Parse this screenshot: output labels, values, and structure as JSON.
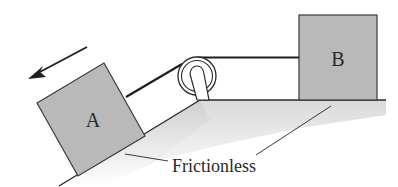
{
  "diagram": {
    "type": "physics-pulley-incline",
    "blocks": [
      {
        "id": "A",
        "label": "A",
        "position": "on incline"
      },
      {
        "id": "B",
        "label": "B",
        "position": "on horizontal surface"
      }
    ],
    "surface_label": "Frictionless",
    "motion_arrow": {
      "direction": "down-left along incline"
    },
    "colors": {
      "block_fill": "#b9b9b9",
      "surface_fill": "#d6d6d6",
      "line": "#2a2a2a"
    }
  }
}
